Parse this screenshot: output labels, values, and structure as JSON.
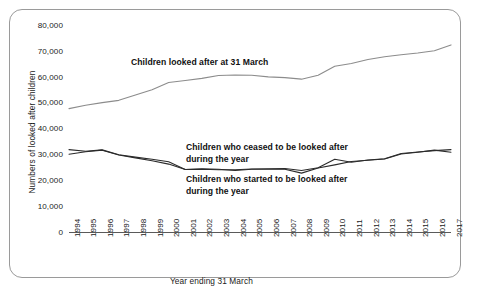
{
  "figure": {
    "border_color": "#9a9a9a",
    "background": "#ffffff"
  },
  "axis": {
    "ylabel": "Numbers of looked after children",
    "xlabel": "Year ending 31 March",
    "yticks": [
      "0",
      "10,000",
      "20,000",
      "30,000",
      "40,000",
      "50,000",
      "60,000",
      "70,000",
      "80,000"
    ]
  },
  "annotations": {
    "total_line1": "Children looked after at 31 March",
    "ceased_line1": "Children who ceased to be looked after",
    "ceased_line2": "during the year",
    "started_line1": "Children who started to be looked after",
    "started_line2": "during the year"
  },
  "chart_data": {
    "type": "line",
    "title": "",
    "xlabel": "Year ending 31 March",
    "ylabel": "Numbers of looked after children",
    "xlim": [
      1994,
      2017
    ],
    "ylim": [
      0,
      80000
    ],
    "ytick_values": [
      0,
      10000,
      20000,
      30000,
      40000,
      50000,
      60000,
      70000,
      80000
    ],
    "grid": false,
    "legend": "annotations-inline",
    "x": [
      1994,
      1995,
      1996,
      1997,
      1998,
      1999,
      2000,
      2001,
      2002,
      2003,
      2004,
      2005,
      2006,
      2007,
      2008,
      2009,
      2010,
      2011,
      2012,
      2013,
      2014,
      2015,
      2016,
      2017
    ],
    "xtick_labels": [
      "1994",
      "1995",
      "1996",
      "1997",
      "1998",
      "1999",
      "2000",
      "2001",
      "2002",
      "2003",
      "2004",
      "2005",
      "2006",
      "2007",
      "2008",
      "2009",
      "2010",
      "2011",
      "2012",
      "2013",
      "2014",
      "2015",
      "2016",
      "2017"
    ],
    "series": [
      {
        "name": "Children looked after at 31 March",
        "color": "#8c8c8c",
        "width": 1.1,
        "values": [
          48000,
          49300,
          50300,
          51200,
          53300,
          55300,
          58100,
          58900,
          59700,
          60800,
          61000,
          60900,
          60300,
          60000,
          59400,
          60900,
          64400,
          65500,
          67050,
          68110,
          68840,
          69540,
          70440,
          72670
        ]
      },
      {
        "name": "Children who started to be looked after during the year",
        "color": "#2b2b2b",
        "width": 1.1,
        "values": [
          30300,
          31300,
          31900,
          30000,
          28900,
          27800,
          26500,
          24400,
          24700,
          24500,
          24000,
          24500,
          24500,
          24500,
          23000,
          25000,
          26200,
          27500,
          28000,
          28500,
          30400,
          31100,
          31900,
          31100
        ]
      },
      {
        "name": "Children who ceased to be looked after during the year",
        "color": "#2b2b2b",
        "width": 1.1,
        "values": [
          32100,
          31500,
          32000,
          30100,
          29200,
          28400,
          27400,
          24400,
          24500,
          24300,
          24300,
          24600,
          24700,
          24800,
          24000,
          25100,
          28400,
          27200,
          28100,
          28600,
          30600,
          31200,
          31700,
          32100
        ]
      }
    ]
  }
}
